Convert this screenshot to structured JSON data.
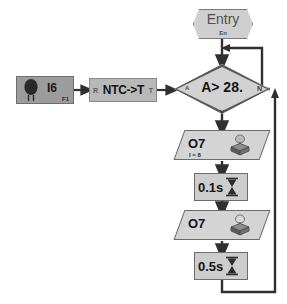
{
  "diagram": {
    "type": "flowchart",
    "colors": {
      "line": "#3a3a3a",
      "node_fill": "#d2d2d2",
      "sensor_fill": "#9c9c9c",
      "process_fill": "#b8b8b8",
      "entry_fill": "#cfcfcf",
      "text": "#141414"
    }
  },
  "entry": {
    "label": "Entry",
    "sublabel": "En",
    "icon": "entry-hexagon-icon"
  },
  "sensor": {
    "label": "I6",
    "sublabel": "F1",
    "icon": "ntc-thermistor-icon"
  },
  "process": {
    "in_port": "R",
    "label": "NTC->T",
    "out_port": "T"
  },
  "decision": {
    "text": "A> 28.",
    "in_port": "A",
    "no_label": "N",
    "yes_label": "Y"
  },
  "steps": [
    {
      "kind": "output",
      "label": "O7",
      "sublabel": "I = 8",
      "icon": "relay-output-icon"
    },
    {
      "kind": "timer",
      "label": "0.1s",
      "icon": "hourglass-icon"
    },
    {
      "kind": "output",
      "label": "O7",
      "sublabel": "",
      "icon": "relay-output-icon"
    },
    {
      "kind": "timer",
      "label": "0.5s",
      "icon": "hourglass-icon"
    }
  ]
}
